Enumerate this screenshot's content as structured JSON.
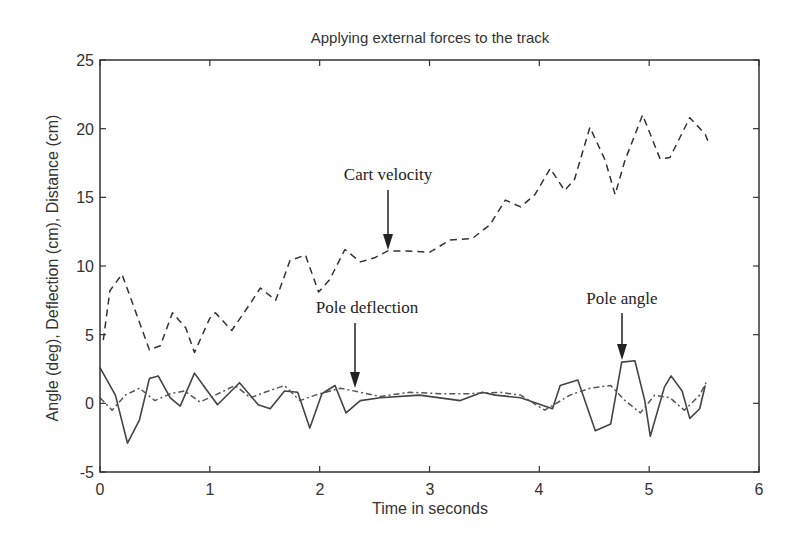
{
  "chart_data": {
    "type": "line",
    "title": "Applying external forces to the track",
    "xlabel": "Time in seconds",
    "ylabel": "Angle (deg),  Deflection (cm),  Distance (cm)",
    "xlim": [
      0,
      6
    ],
    "ylim": [
      -5,
      25
    ],
    "xticks": [
      0,
      1,
      2,
      3,
      4,
      5,
      6
    ],
    "yticks": [
      -5,
      0,
      5,
      10,
      15,
      20,
      25
    ],
    "grid": false,
    "legend": null,
    "series": [
      {
        "name": "Cart velocity",
        "style": "dashed",
        "color": "#333333",
        "x": [
          0.03,
          0.09,
          0.2,
          0.45,
          0.55,
          0.66,
          0.78,
          0.86,
          1.0,
          1.05,
          1.2,
          1.37,
          1.46,
          1.6,
          1.73,
          1.87,
          1.99,
          2.09,
          2.23,
          2.37,
          2.5,
          2.62,
          2.78,
          3.0,
          3.19,
          3.39,
          3.55,
          3.69,
          3.83,
          3.96,
          4.1,
          4.23,
          4.32,
          4.46,
          4.6,
          4.69,
          4.78,
          4.94,
          5.1,
          5.19,
          5.37,
          5.51,
          5.55
        ],
        "y": [
          4.6,
          8.2,
          9.4,
          3.9,
          4.2,
          6.6,
          5.5,
          3.7,
          6.2,
          6.6,
          5.3,
          7.3,
          8.4,
          7.5,
          10.4,
          10.8,
          8.1,
          9.0,
          11.2,
          10.3,
          10.6,
          11.1,
          11.1,
          11.0,
          11.9,
          12.0,
          13.0,
          14.8,
          14.3,
          15.2,
          17.1,
          15.5,
          16.3,
          20.1,
          17.7,
          15.2,
          17.7,
          21.0,
          17.8,
          17.9,
          20.8,
          19.6,
          18.8
        ]
      },
      {
        "name": "Pole angle",
        "style": "solid",
        "color": "#444444",
        "x": [
          0,
          0.14,
          0.25,
          0.36,
          0.45,
          0.53,
          0.64,
          0.73,
          0.86,
          0.96,
          1.07,
          1.27,
          1.44,
          1.55,
          1.68,
          1.8,
          1.91,
          2.02,
          2.14,
          2.24,
          2.37,
          2.55,
          2.91,
          3.28,
          3.48,
          3.6,
          3.83,
          4.12,
          4.19,
          4.35,
          4.51,
          4.65,
          4.75,
          4.87,
          4.96,
          5.01,
          5.14,
          5.2,
          5.3,
          5.37,
          5.46,
          5.51
        ],
        "y": [
          2.6,
          0.6,
          -2.9,
          -1.2,
          1.8,
          2.0,
          0.4,
          -0.2,
          2.2,
          1.1,
          -0.1,
          1.5,
          -0.1,
          -0.4,
          0.9,
          0.8,
          -1.8,
          0.7,
          1.3,
          -0.7,
          0.2,
          0.4,
          0.6,
          0.2,
          0.8,
          0.6,
          0.4,
          -0.4,
          1.3,
          1.7,
          -2.0,
          -1.5,
          3.0,
          3.1,
          0.2,
          -2.4,
          1.2,
          2.0,
          0.9,
          -1.1,
          -0.4,
          1.3
        ]
      },
      {
        "name": "Pole deflection",
        "style": "dashdot",
        "color": "#555555",
        "x": [
          0,
          0.11,
          0.23,
          0.36,
          0.5,
          0.64,
          0.77,
          0.91,
          1.05,
          1.23,
          1.37,
          1.5,
          1.68,
          1.82,
          1.96,
          2.19,
          2.37,
          2.55,
          2.82,
          3.1,
          3.37,
          3.64,
          3.83,
          4.05,
          4.28,
          4.46,
          4.65,
          4.78,
          4.92,
          5.05,
          5.19,
          5.32,
          5.46,
          5.53
        ],
        "y": [
          0.4,
          -0.5,
          0.6,
          1.1,
          0.2,
          0.7,
          0.9,
          0.1,
          0.6,
          1.3,
          0.4,
          0.8,
          1.3,
          0.2,
          0.6,
          1.1,
          0.8,
          0.5,
          0.8,
          0.7,
          0.7,
          0.8,
          0.6,
          -0.5,
          0.6,
          1.1,
          1.3,
          0.2,
          -0.7,
          0.6,
          0.4,
          -0.5,
          0.6,
          1.7
        ]
      }
    ],
    "annotations": [
      {
        "text": "Cart velocity",
        "arrow_to": [
          2.62,
          11.1
        ],
        "text_at": [
          2.62,
          16.6
        ]
      },
      {
        "text": "Pole deflection",
        "arrow_to": [
          2.3,
          1.1
        ],
        "text_at": [
          2.3,
          5.9
        ]
      },
      {
        "text": "Pole angle",
        "arrow_to": [
          4.75,
          3.3
        ],
        "text_at": [
          4.75,
          8.7
        ]
      }
    ]
  },
  "plot": {
    "title": "Applying external forces to the track",
    "xlabel": "Time in seconds",
    "ylabel": "Angle (deg),  Deflection (cm),  Distance (cm)",
    "xtick_labels": [
      "0",
      "1",
      "2",
      "3",
      "4",
      "5",
      "6"
    ],
    "ytick_labels": [
      "-5",
      "0",
      "5",
      "10",
      "15",
      "20",
      "25"
    ],
    "annotations": [
      "Cart velocity",
      "Pole deflection",
      "Pole angle"
    ]
  }
}
